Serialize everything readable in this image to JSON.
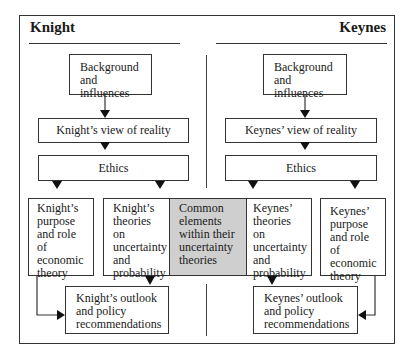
{
  "diagram": {
    "left_title": "Knight",
    "right_title": "Keynes",
    "knight": {
      "background": [
        "Background",
        "and influences"
      ],
      "view": "Knight’s view of reality",
      "ethics": "Ethics",
      "purpose": [
        "Knight’s",
        "purpose",
        "and role of",
        "economic",
        "theory"
      ],
      "theories": [
        "Knight’s",
        "theories",
        "on",
        "uncertainty",
        "and",
        "probability"
      ],
      "outlook": [
        "Knight’s outlook",
        "and policy",
        "recommendations"
      ]
    },
    "common": [
      "Common",
      "elements",
      "within their",
      "uncertainty",
      "theories"
    ],
    "keynes": {
      "background": [
        "Background",
        "and influences"
      ],
      "view": "Keynes’ view of reality",
      "ethics": "Ethics",
      "theories": [
        "Keynes’",
        "theories on",
        "uncertainty",
        "and",
        "probability"
      ],
      "purpose": [
        "Keynes’",
        "purpose",
        "and role of",
        "economic",
        "theory"
      ],
      "outlook": [
        "Keynes’ outlook",
        "and policy",
        "recommendations"
      ]
    },
    "colors": {
      "line": "#333333",
      "common_fill": "#cfcfcf",
      "background": "#ffffff"
    }
  }
}
